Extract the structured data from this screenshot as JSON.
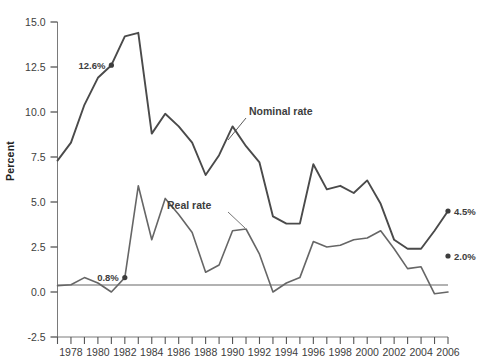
{
  "chart_data": {
    "type": "line",
    "title": "",
    "xlabel": "",
    "ylabel": "Percent",
    "xlim": [
      1977,
      2006
    ],
    "ylim": [
      -2.5,
      15.0
    ],
    "grid": false,
    "legend_position": "inline-annotation",
    "y_ticks": [
      "15.0",
      "12.5",
      "10.0",
      "7.5",
      "5.0",
      "2.5",
      "0.0",
      "-2.5"
    ],
    "y_tick_values": [
      15.0,
      12.5,
      10.0,
      7.5,
      5.0,
      2.5,
      0.0,
      -2.5
    ],
    "x_ticks": [
      1977,
      1978,
      1979,
      1980,
      1981,
      1982,
      1983,
      1984,
      1985,
      1986,
      1987,
      1988,
      1989,
      1990,
      1991,
      1992,
      1993,
      1994,
      1995,
      1996,
      1997,
      1998,
      1999,
      2000,
      2001,
      2002,
      2003,
      2004,
      2005,
      2006
    ],
    "x_tick_labels": [
      "1978",
      "1980",
      "1982",
      "1984",
      "1986",
      "1988",
      "1990",
      "1992",
      "1994",
      "1996",
      "1998",
      "2000",
      "2002",
      "2004",
      "2006"
    ],
    "x_tick_label_years": [
      1978,
      1980,
      1982,
      1984,
      1986,
      1988,
      1990,
      1992,
      1994,
      1996,
      1998,
      2000,
      2002,
      2004,
      2006
    ],
    "x": [
      1977,
      1978,
      1979,
      1980,
      1981,
      1982,
      1983,
      1984,
      1985,
      1986,
      1987,
      1988,
      1989,
      1990,
      1991,
      1992,
      1993,
      1994,
      1995,
      1996,
      1997,
      1998,
      1999,
      2000,
      2001,
      2002,
      2003,
      2004,
      2005,
      2006
    ],
    "series": [
      {
        "name": "Nominal rate",
        "color": "#4a4a4a",
        "values": [
          7.3,
          8.3,
          10.4,
          11.9,
          12.6,
          14.2,
          14.4,
          8.8,
          9.9,
          9.2,
          8.3,
          6.5,
          7.6,
          9.2,
          8.1,
          7.2,
          4.2,
          3.8,
          3.8,
          7.1,
          5.7,
          5.9,
          5.5,
          6.2,
          4.9,
          2.9,
          2.4,
          2.4,
          3.4,
          4.5
        ]
      },
      {
        "name": "Real rate",
        "color": "#666666",
        "values": [
          0.35,
          0.4,
          0.8,
          0.5,
          0.0,
          0.8,
          5.9,
          2.9,
          5.2,
          4.3,
          3.3,
          1.1,
          1.5,
          3.4,
          3.5,
          2.1,
          0.0,
          0.5,
          0.8,
          2.8,
          2.5,
          2.6,
          2.9,
          3.0,
          3.4,
          2.4,
          1.3,
          1.4,
          -0.1,
          0.0
        ]
      }
    ],
    "annotations": [
      {
        "name": "nominal-1981-label",
        "text": "12.6%",
        "year": 1981,
        "value": 12.6,
        "marker": true
      },
      {
        "name": "real-1982-label",
        "text": "0.8%",
        "year": 1982,
        "value": 0.8,
        "marker": true
      },
      {
        "name": "nominal-2006-label",
        "text": "4.5%",
        "year": 2006,
        "value": 4.5,
        "marker": true
      },
      {
        "name": "real-2006-label",
        "text": "2.0%",
        "year": 2006,
        "value": 2.0,
        "marker": true
      }
    ],
    "series_callouts": [
      {
        "name": "nominal-rate-callout",
        "text": "Nominal rate"
      },
      {
        "name": "real-rate-callout",
        "text": "Real rate"
      }
    ]
  },
  "axis": {
    "y_label": "Percent",
    "y_tick_0": "15.0",
    "y_tick_1": "12.5",
    "y_tick_2": "10.0",
    "y_tick_3": "7.5",
    "y_tick_4": "5.0",
    "y_tick_5": "2.5",
    "y_tick_6": "0.0",
    "y_tick_7": "-2.5",
    "x_tick_0": "1978",
    "x_tick_1": "1980",
    "x_tick_2": "1982",
    "x_tick_3": "1984",
    "x_tick_4": "1986",
    "x_tick_5": "1988",
    "x_tick_6": "1990",
    "x_tick_7": "1992",
    "x_tick_8": "1994",
    "x_tick_9": "1996",
    "x_tick_10": "1998",
    "x_tick_11": "2000",
    "x_tick_12": "2002",
    "x_tick_13": "2004",
    "x_tick_14": "2006"
  },
  "labels": {
    "nominal_rate": "Nominal rate",
    "real_rate": "Real rate",
    "pt_126": "12.6%",
    "pt_08": "0.8%",
    "pt_45": "4.5%",
    "pt_20": "2.0%"
  },
  "colors": {
    "nominal_line": "#4a4a4a",
    "real_line": "#666666",
    "axis": "#555555",
    "text": "#3d3d3d",
    "background": "#ffffff"
  }
}
